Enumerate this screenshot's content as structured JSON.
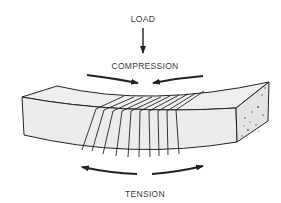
{
  "diagram": {
    "labels": {
      "load": "LOAD",
      "compression": "COMPRESSION",
      "tension": "TENSION"
    },
    "colors": {
      "background": "#ffffff",
      "stroke": "#222222",
      "beam_fill": "#eeeeee",
      "end_face_fill": "#e4e4e4",
      "text": "#3a3a3a"
    },
    "elements": [
      {
        "name": "load-arrow",
        "direction": "down"
      },
      {
        "name": "compression-arrows",
        "direction": "inward"
      },
      {
        "name": "beam",
        "shape": "curved rectangular prism"
      },
      {
        "name": "tension-arrows",
        "direction": "outward"
      }
    ]
  }
}
